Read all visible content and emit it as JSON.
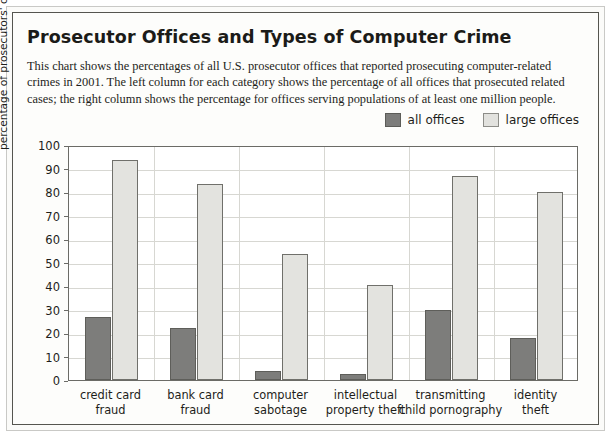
{
  "figure": {
    "title": "Prosecutor Offices and Types of Computer Crime",
    "description": "This chart shows the percentages of all U.S. prosecutor offices that reported prosecuting computer-related crimes in 2001. The left column for each category shows the percentage of all offices that prosecuted related cases; the right column shows the percentage for offices serving populations of at least one million people."
  },
  "legend": {
    "position": "top-right",
    "items": [
      {
        "label": "all offices",
        "color": "#7d7d7b",
        "swatch": "dark"
      },
      {
        "label": "large offices",
        "color": "#e3e3df",
        "swatch": "light"
      }
    ]
  },
  "chart_data": {
    "type": "bar",
    "title": "Prosecutor Offices and Types of Computer Crime",
    "xlabel": "",
    "ylabel": "percentage of prosecutors' offices",
    "ylim": [
      0,
      100
    ],
    "ytick_labels": [
      "0",
      "10",
      "20",
      "30",
      "40",
      "50",
      "60",
      "70",
      "80",
      "90",
      "100"
    ],
    "yticks": [
      0,
      10,
      20,
      30,
      40,
      50,
      60,
      70,
      80,
      90,
      100
    ],
    "grid": true,
    "categories": [
      "credit card fraud",
      "bank card fraud",
      "computer sabotage",
      "intellectual property theft",
      "transmitting child pornography",
      "identity theft"
    ],
    "category_lines": [
      [
        "credit card",
        "fraud"
      ],
      [
        "bank card",
        "fraud"
      ],
      [
        "computer",
        "sabotage"
      ],
      [
        "intellectual",
        "property theft"
      ],
      [
        "transmitting",
        "child pornography"
      ],
      [
        "identity",
        "theft"
      ]
    ],
    "series": [
      {
        "name": "all offices",
        "color": "#7d7d7b",
        "values": [
          27,
          22,
          4,
          2.5,
          30,
          18
        ]
      },
      {
        "name": "large offices",
        "color": "#e3e3df",
        "values": [
          93.5,
          83.5,
          53.5,
          40.5,
          87,
          80
        ]
      }
    ]
  }
}
